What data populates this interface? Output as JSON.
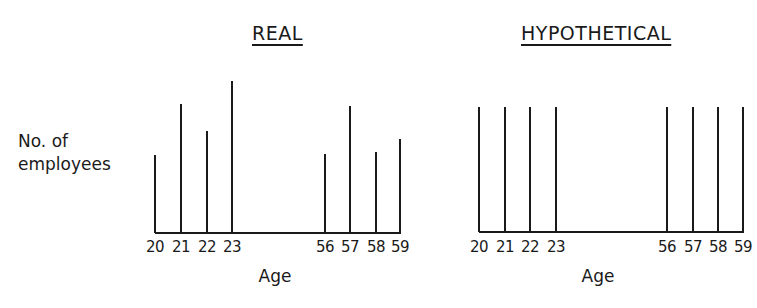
{
  "chart_data": [
    {
      "type": "bar",
      "title": "REAL",
      "xlabel": "Age",
      "ylabel": "No. of employees",
      "categories": [
        "20",
        "21",
        "22",
        "23",
        "56",
        "57",
        "58",
        "59"
      ],
      "values": [
        78,
        129,
        102,
        152,
        79,
        127,
        81,
        94
      ],
      "note": "relative heights (no y-axis scale shown)",
      "grid": false
    },
    {
      "type": "bar",
      "title": "HYPOTHETICAL",
      "xlabel": "Age",
      "ylabel": "No. of employees",
      "categories": [
        "20",
        "21",
        "22",
        "23",
        "56",
        "57",
        "58",
        "59"
      ],
      "values": [
        125,
        125,
        125,
        125,
        125,
        125,
        125,
        125
      ],
      "note": "relative heights (no y-axis scale shown)",
      "grid": false
    }
  ],
  "ylabel_line1": "No. of",
  "ylabel_line2": "employees",
  "real": {
    "title": "REAL",
    "xlabel": "Age",
    "ticks": [
      "20",
      "21",
      "22",
      "23",
      "56",
      "57",
      "58",
      "59"
    ]
  },
  "hypo": {
    "title": "HYPOTHETICAL",
    "xlabel": "Age",
    "ticks": [
      "20",
      "21",
      "22",
      "23",
      "56",
      "57",
      "58",
      "59"
    ]
  }
}
